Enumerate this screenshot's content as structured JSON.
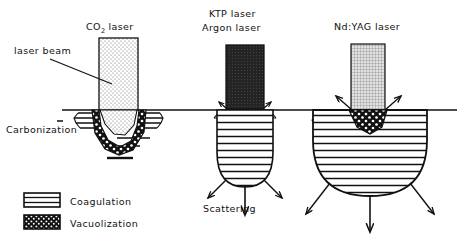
{
  "figure": {
    "kind": "medical-laser-tissue-interaction-diagram",
    "background_color": "#ffffff",
    "ink_color": "#111111"
  },
  "panels": [
    {
      "id": "co2",
      "title": "CO",
      "title_subscript": "2",
      "title_suffix": " laser",
      "beam_fill": "light-stipple",
      "beam_color": "#f2f2f2",
      "effect": "vacuolization-crater",
      "annotations": [
        "laser beam",
        "Carbonization"
      ]
    },
    {
      "id": "ktp-argon",
      "title_line1": "KTP laser",
      "title_line2": "Argon laser",
      "beam_fill": "dark-solid",
      "beam_color": "#2a2a2a",
      "effect": "coagulation-bulb",
      "annotations": [
        "Scattering"
      ]
    },
    {
      "id": "ndyag",
      "title": "Nd:YAG laser",
      "beam_fill": "grid-mesh",
      "beam_color": "#b8b8b8",
      "effect": "coagulation-sphere",
      "annotations": []
    }
  ],
  "labels": {
    "co2_title_main": "CO",
    "co2_title_sub": "2",
    "co2_title_tail": "laser",
    "ktp_line1": "KTP laser",
    "ktp_line2": "Argon laser",
    "ndyag_title": "Nd:YAG laser",
    "laser_beam": "laser beam",
    "carbonization": "Carbonization",
    "scattering": "Scattering"
  },
  "legend": {
    "items": [
      {
        "label": "Coagulation",
        "pattern": "horizontal-stripes"
      },
      {
        "label": "Vacuolization",
        "pattern": "dark-dotted"
      }
    ]
  },
  "colors": {
    "ink": "#111111",
    "beam_co2": "#f2f2f2",
    "beam_ktp": "#2a2a2a",
    "beam_ndyag": "#b8b8b8",
    "tissue_fill": "#ffffff"
  }
}
